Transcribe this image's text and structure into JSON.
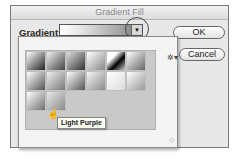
{
  "dialog": {
    "title": "Gradient Fill",
    "gradient_label": "Gradient:",
    "dropdown_arrow_icon": "triangle-down-icon",
    "buttons": {
      "ok": "OK",
      "cancel": "Cancel"
    }
  },
  "picker": {
    "gear_icon": "gear-icon",
    "gear_glyph": "✲▾",
    "resize_glyph": "◇",
    "swatches": [
      {
        "row": 0,
        "col": 0,
        "gradient": "linear-gradient(135deg,#ffffff,#222222)"
      },
      {
        "row": 0,
        "col": 1,
        "gradient": "linear-gradient(135deg,#f0f0f0,#444444)"
      },
      {
        "row": 0,
        "col": 2,
        "gradient": "linear-gradient(135deg,#dddddd,#333333)"
      },
      {
        "row": 0,
        "col": 3,
        "gradient": "linear-gradient(135deg,#ffffff,#888888)"
      },
      {
        "row": 0,
        "col": 4,
        "gradient": "linear-gradient(135deg,#ffffff 30%,#000000 60%,#cccccc)"
      },
      {
        "row": 0,
        "col": 5,
        "gradient": "linear-gradient(135deg,#ffffff,#666666)"
      },
      {
        "row": 1,
        "col": 0,
        "gradient": "linear-gradient(135deg,#ffffff,#555555)"
      },
      {
        "row": 1,
        "col": 1,
        "gradient": "linear-gradient(135deg,#eeeeee,#777777)"
      },
      {
        "row": 1,
        "col": 2,
        "gradient": "linear-gradient(135deg,#ffffff,#555555)"
      },
      {
        "row": 1,
        "col": 3,
        "gradient": "linear-gradient(135deg,#f5f5f5,#8a8a8a)"
      },
      {
        "row": 1,
        "col": 4,
        "gradient": "linear-gradient(135deg,#ffffff,#dddddd)"
      },
      {
        "row": 1,
        "col": 5,
        "gradient": "linear-gradient(135deg,#ffffff,#999999)"
      },
      {
        "row": 2,
        "col": 0,
        "gradient": "linear-gradient(135deg,#ffffff,#707070)"
      },
      {
        "row": 2,
        "col": 1,
        "gradient": "linear-gradient(135deg,#e8e8e8,#8a8a8a)"
      }
    ],
    "tooltip": "Light Purple",
    "cursor_icon": "hand-pointer-icon",
    "cursor_glyph": "☝"
  }
}
